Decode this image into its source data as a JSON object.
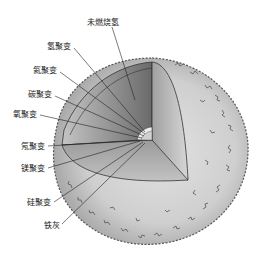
{
  "diagram": {
    "labels": [
      {
        "id": "unburned-hydrogen",
        "text": "未燃烧氢",
        "x": 87,
        "y": 18
      },
      {
        "id": "hydrogen-fusion",
        "text": "氢聚变",
        "x": 47,
        "y": 42
      },
      {
        "id": "helium-fusion",
        "text": "氦聚变",
        "x": 33,
        "y": 66
      },
      {
        "id": "carbon-fusion",
        "text": "碳聚变",
        "x": 28,
        "y": 90
      },
      {
        "id": "oxygen-fusion",
        "text": "氧聚变",
        "x": 13,
        "y": 110
      },
      {
        "id": "neon-fusion",
        "text": "氖聚变",
        "x": 21,
        "y": 142
      },
      {
        "id": "magnesium-fusion",
        "text": "镁聚变",
        "x": 21,
        "y": 164
      },
      {
        "id": "silicon-fusion",
        "text": "硅聚变",
        "x": 27,
        "y": 198
      },
      {
        "id": "iron-ash",
        "text": "铁灰",
        "x": 44,
        "y": 221
      }
    ],
    "colors": {
      "outer_envelope": "#c9c9c9",
      "cut_face_light": "#b8b8b8",
      "cut_face_dark": "#5f5f5f",
      "outline": "#333333",
      "background": "#ffffff"
    }
  }
}
